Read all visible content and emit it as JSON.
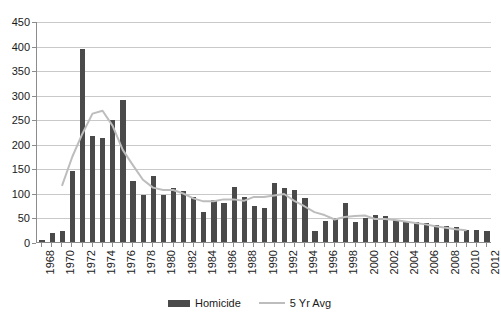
{
  "chart_data": {
    "type": "bar",
    "title": "",
    "subtitle": "",
    "xlabel": "",
    "ylabel": "",
    "ylim": [
      0,
      450
    ],
    "ytick_step": 50,
    "yticks": [
      0,
      50,
      100,
      150,
      200,
      250,
      300,
      350,
      400,
      450
    ],
    "grid": true,
    "legend_position": "bottom",
    "x_tick_interval": 2,
    "categories": [
      "1968",
      "1969",
      "1970",
      "1971",
      "1972",
      "1973",
      "1974",
      "1975",
      "1976",
      "1977",
      "1978",
      "1979",
      "1980",
      "1981",
      "1982",
      "1983",
      "1984",
      "1985",
      "1986",
      "1987",
      "1988",
      "1989",
      "1990",
      "1991",
      "1992",
      "1993",
      "1994",
      "1995",
      "1996",
      "1997",
      "1998",
      "1999",
      "2000",
      "2001",
      "2002",
      "2003",
      "2004",
      "2005",
      "2006",
      "2007",
      "2008",
      "2009",
      "2010",
      "2011",
      "2012"
    ],
    "series": [
      {
        "name": "Homicide",
        "type": "bar",
        "color": "#4a4a4a",
        "values": [
          5,
          18,
          22,
          145,
          393,
          215,
          211,
          248,
          290,
          124,
          95,
          135,
          95,
          110,
          103,
          92,
          62,
          85,
          80,
          112,
          92,
          73,
          70,
          120,
          110,
          105,
          90,
          22,
          43,
          48,
          80,
          40,
          48,
          55,
          52,
          45,
          42,
          40,
          38,
          35,
          32,
          30,
          25,
          24,
          22
        ]
      },
      {
        "name": "5 Yr Avg",
        "type": "line",
        "color": "#bdbdbd",
        "values": [
          null,
          null,
          117,
          175,
          222,
          263,
          269,
          238,
          189,
          158,
          128,
          112,
          107,
          107,
          100,
          90,
          84,
          84,
          88,
          88,
          85,
          93,
          93,
          96,
          99,
          85,
          74,
          62,
          56,
          47,
          52,
          54,
          55,
          48,
          48,
          46,
          43,
          40,
          37,
          33,
          30,
          27,
          25,
          null,
          null
        ]
      }
    ]
  },
  "legend": {
    "items": [
      {
        "label": "Homicide",
        "marker": "bar-swatch"
      },
      {
        "label": "5 Yr Avg",
        "marker": "line-swatch"
      }
    ]
  },
  "colors": {
    "bar": "#4a4a4a",
    "line": "#bdbdbd",
    "gridline": "#c9c9c9",
    "axis": "#8c8c8c",
    "text": "#1a1a1a",
    "background": "#ffffff"
  }
}
